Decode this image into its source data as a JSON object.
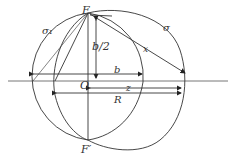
{
  "diagram": {
    "labels": {
      "F": "F",
      "F_prime": "F′",
      "O": "O",
      "sigma": "σ",
      "sigma1": "σ₁",
      "b_half": "b/2",
      "b": "b",
      "x": "x",
      "z": "z",
      "R": "R"
    },
    "colors": {
      "stroke": "#333333",
      "axis": "#666666",
      "background": "#ffffff"
    }
  }
}
